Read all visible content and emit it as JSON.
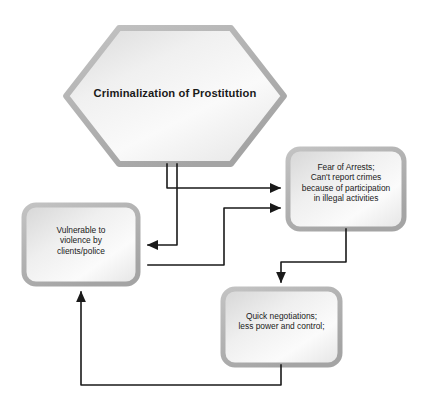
{
  "diagram": {
    "type": "flowchart",
    "title_node": {
      "id": "criminalization",
      "shape": "hexagon",
      "text": "Criminalization of Prostitution"
    },
    "nodes": [
      {
        "id": "fear-of-arrests",
        "shape": "rounded-rectangle",
        "text": "Fear of Arrests;\nCan't report crimes\nbecause of participation\nin illegal activities",
        "lines": [
          "Fear of Arrests;",
          "Can't report crimes",
          "because of participation",
          "in illegal activities"
        ]
      },
      {
        "id": "vulnerable-to-violence",
        "shape": "rounded-rectangle",
        "text": "Vulnerable to\nviolence by\nclients/police",
        "lines": [
          "Vulnerable to",
          "violence by",
          "clients/police"
        ]
      },
      {
        "id": "quick-negotiations",
        "shape": "rounded-rectangle",
        "text": "Quick negotiations;\nless power and control;",
        "lines": [
          "Quick negotiations;",
          "less power and control;"
        ]
      }
    ],
    "edges": [
      {
        "from": "criminalization",
        "to": "fear-of-arrests",
        "arrow": "right"
      },
      {
        "from": "criminalization",
        "to": "vulnerable-to-violence",
        "arrow": "left"
      },
      {
        "from": "fear-of-arrests",
        "to": "quick-negotiations",
        "arrow": "down"
      },
      {
        "from": "quick-negotiations",
        "to": "vulnerable-to-violence",
        "arrow": "up"
      },
      {
        "from": "vulnerable-to-violence",
        "to": "fear-of-arrests",
        "arrow": "right"
      }
    ],
    "colors": {
      "node_fill_light": "#f2f2f2",
      "node_fill_dark": "#cfcfcf",
      "node_border": "#b0b0b0",
      "connector": "#1a1a1a",
      "text": "#1a1a1a",
      "background": "#ffffff"
    }
  }
}
